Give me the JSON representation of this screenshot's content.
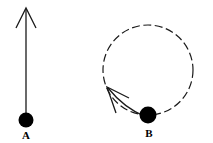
{
  "figure": {
    "width": 213,
    "height": 143,
    "background_color": "#ffffff",
    "ink_color": "#1a1a1a"
  },
  "chart_data": {
    "type": "diagram",
    "title": "",
    "xlabel": "",
    "ylabel": "",
    "items": [
      {
        "id": "A",
        "label": "A",
        "label_x": 26,
        "label_y": 139,
        "ball": {
          "cx": 26,
          "cy": 120,
          "r": 7.5,
          "fill": "#000000"
        },
        "path": {
          "kind": "none"
        },
        "arrow": {
          "kind": "straight",
          "x1": 26,
          "y1": 113,
          "x2": 26,
          "y2": 9,
          "head_apex_x": 26,
          "head_apex_y": 8,
          "head_left_x": 16,
          "head_left_y": 28,
          "head_right_x": 36,
          "head_right_y": 28,
          "stroke_width": 1.3
        }
      },
      {
        "id": "B",
        "label": "B",
        "label_x": 149,
        "label_y": 137,
        "ball": {
          "cx": 148,
          "cy": 115,
          "r": 8.5,
          "fill": "#000000"
        },
        "path": {
          "kind": "dashed-circle",
          "cx": 148,
          "cy": 70,
          "r": 45,
          "dash": "8 3.5",
          "stroke_width": 1.2
        },
        "arrow": {
          "kind": "curved-tangent",
          "start_x": 146,
          "start_y": 117,
          "ctrl_x": 124,
          "ctrl_y": 108,
          "end_x": 108,
          "end_y": 88,
          "head_apex_x": 107,
          "head_apex_y": 87,
          "head_barb1_x": 129,
          "head_barb1_y": 98,
          "head_barb2_x": 116,
          "head_barb2_y": 113,
          "stroke_width": 1.3
        }
      }
    ],
    "legend": [],
    "annotations": [
      {
        "text": "A",
        "x": 26,
        "y": 139
      },
      {
        "text": "B",
        "x": 149,
        "y": 137
      }
    ]
  }
}
